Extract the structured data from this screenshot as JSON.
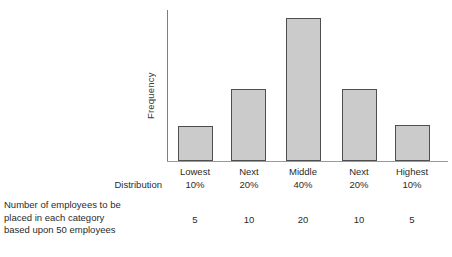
{
  "chart_data": {
    "type": "bar",
    "title": "",
    "xlabel": "",
    "ylabel": "Frequency",
    "categories": [
      "Lowest 10%",
      "Next 20%",
      "Middle 40%",
      "Next 20%",
      "Highest 10%"
    ],
    "category_names": [
      "Lowest",
      "Next",
      "Middle",
      "Next",
      "Highest"
    ],
    "category_percents": [
      "10%",
      "20%",
      "40%",
      "20%",
      "10%"
    ],
    "values": [
      5,
      10,
      20,
      10,
      5
    ],
    "value_unit": "employees",
    "ylim": [
      0,
      22
    ],
    "grid": false,
    "legend": "none",
    "axis_tick_labels": [],
    "bar_fill_color": "#cbcbcb",
    "bar_border_color": "#4f4f4f",
    "axis_color": "#7d7d7d",
    "bars": [
      {
        "label": "Lowest 10%",
        "value": 5,
        "left_pct": 4.0,
        "width_pct": 12.5,
        "height_pct": 23.0
      },
      {
        "label": "Next 20%",
        "value": 10,
        "left_pct": 22.8,
        "width_pct": 12.5,
        "height_pct": 47.7
      },
      {
        "label": "Middle 40%",
        "value": 20,
        "left_pct": 42.3,
        "width_pct": 12.5,
        "height_pct": 94.7
      },
      {
        "label": "Next 20%",
        "value": 10,
        "left_pct": 62.3,
        "width_pct": 12.5,
        "height_pct": 47.7
      },
      {
        "label": "Highest 10%",
        "value": 5,
        "left_pct": 81.1,
        "width_pct": 12.5,
        "height_pct": 24.0
      }
    ]
  },
  "axis": {
    "y_title": "Frequency"
  },
  "rows": {
    "distribution_label": "Distribution",
    "employees_note_line1": "Number of employees to be",
    "employees_note_line2": "placed in each category",
    "employees_note_line3": "based upon 50 employees"
  },
  "columns": [
    {
      "name": "Lowest",
      "percent": "10%",
      "count": "5",
      "center_px": 195
    },
    {
      "name": "Next",
      "percent": "20%",
      "count": "10",
      "center_px": 249
    },
    {
      "name": "Middle",
      "percent": "40%",
      "count": "20",
      "center_px": 303
    },
    {
      "name": "Next",
      "percent": "20%",
      "count": "10",
      "center_px": 359
    },
    {
      "name": "Highest",
      "percent": "10%",
      "count": "5",
      "center_px": 412
    }
  ]
}
